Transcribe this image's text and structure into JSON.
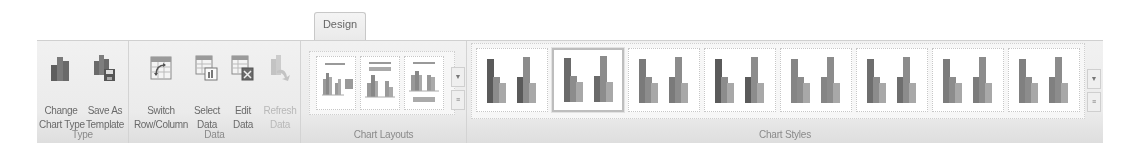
{
  "ribbon": {
    "active_tab": "Design",
    "groups": [
      {
        "label": "Type",
        "buttons": [
          {
            "name": "change-chart-type",
            "line1": "Change",
            "line2": "Chart Type",
            "icon": "column-chart-icon",
            "enabled": true
          },
          {
            "name": "save-as-template",
            "line1": "Save As",
            "line2": "Template",
            "icon": "save-template-icon",
            "enabled": true
          }
        ]
      },
      {
        "label": "Data",
        "buttons": [
          {
            "name": "switch-row-column",
            "line1": "Switch",
            "line2": "Row/Column",
            "icon": "switch-row-column-icon",
            "enabled": true
          },
          {
            "name": "select-data",
            "line1": "Select",
            "line2": "Data",
            "icon": "select-data-icon",
            "enabled": true
          },
          {
            "name": "edit-data",
            "line1": "Edit",
            "line2": "Data",
            "icon": "edit-data-icon",
            "enabled": true
          },
          {
            "name": "refresh-data",
            "line1": "Refresh",
            "line2": "Data",
            "icon": "refresh-data-icon",
            "enabled": false
          }
        ]
      },
      {
        "label": "Chart Layouts",
        "layouts": [
          "Layout 1",
          "Layout 2",
          "Layout 3"
        ]
      },
      {
        "label": "Chart Styles",
        "styles": [
          "Style 1",
          "Style 2",
          "Style 3",
          "Style 4",
          "Style 5",
          "Style 6",
          "Style 7",
          "Style 8"
        ],
        "selected_index": 1
      }
    ]
  },
  "colors": {
    "ribbon_bg": "#ebebeb",
    "label_text": "#8a8a8a",
    "bar_dark": "#5a5a5a",
    "bar_mid": "#8c8c8c",
    "bar_light": "#a8a8a8"
  }
}
